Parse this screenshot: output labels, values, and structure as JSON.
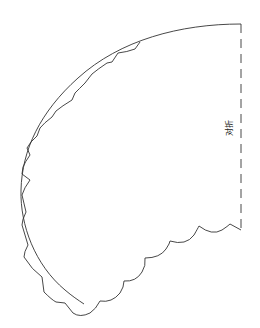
{
  "diagram": {
    "title": "",
    "fold_label": "对折",
    "line_color": "#333333",
    "background_color": "#ffffff",
    "parts": [
      {
        "name": "outer-arc",
        "style": "solid"
      },
      {
        "name": "scalloped-edge",
        "style": "solid"
      },
      {
        "name": "fold-line",
        "style": "dashed"
      }
    ]
  }
}
